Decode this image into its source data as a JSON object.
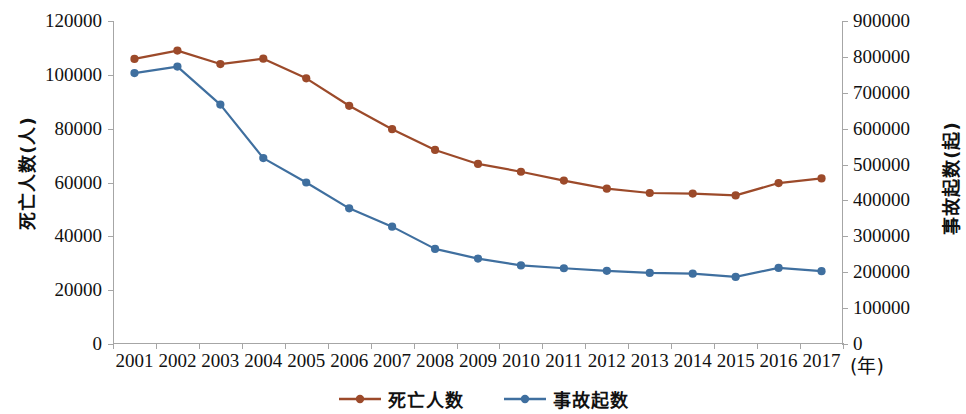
{
  "chart_data": {
    "type": "line",
    "title": "",
    "xlabel": "(年)",
    "ylabel": "死亡人数(人)",
    "y2label": "事故起数(起)",
    "categories": [
      "2001",
      "2002",
      "2003",
      "2004",
      "2005",
      "2006",
      "2007",
      "2008",
      "2009",
      "2010",
      "2011",
      "2012",
      "2013",
      "2014",
      "2015",
      "2016",
      "2017"
    ],
    "ylim": [
      0,
      120000
    ],
    "yticks": [
      "0",
      "20000",
      "40000",
      "60000",
      "80000",
      "100000",
      "120000"
    ],
    "y2lim": [
      0,
      900000
    ],
    "y2ticks": [
      "0",
      "100000",
      "200000",
      "300000",
      "400000",
      "500000",
      "600000",
      "700000",
      "800000",
      "900000"
    ],
    "grid": false,
    "legend_position": "bottom",
    "series": [
      {
        "name": "死亡人数",
        "axis": "left",
        "color": "#9c4a2a",
        "marker": "circle",
        "values": [
          105900,
          109000,
          104000,
          106000,
          98700,
          88500,
          79800,
          72100,
          66900,
          64000,
          60700,
          57700,
          56100,
          55900,
          55200,
          59800,
          61500
        ]
      },
      {
        "name": "事故起数",
        "axis": "right",
        "color": "#3f6f9f",
        "marker": "circle",
        "values": [
          755000,
          773000,
          667000,
          518000,
          450000,
          378000,
          327000,
          265000,
          238000,
          219000,
          211000,
          204000,
          198000,
          196000,
          187000,
          212000,
          203000
        ]
      }
    ]
  },
  "axes": {
    "left_title": "死亡人数(人)",
    "right_title": "事故起数(起)",
    "x_unit": "(年)"
  },
  "legend": {
    "items": [
      {
        "label": "死亡人数",
        "color": "#9c4a2a"
      },
      {
        "label": "事故起数",
        "color": "#3f6f9f"
      }
    ]
  }
}
